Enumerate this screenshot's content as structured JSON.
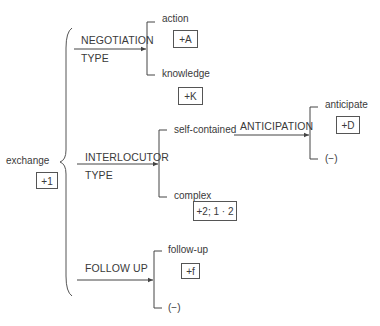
{
  "root": {
    "label": "exchange",
    "feature": "+1"
  },
  "systems": [
    {
      "name_line1": "NEGOTIATION",
      "name_line2": "TYPE",
      "options": [
        {
          "label": "action",
          "feature": "+A"
        },
        {
          "label": "knowledge",
          "feature": "+K"
        }
      ]
    },
    {
      "name_line1": "INTERLOCUTOR",
      "name_line2": "TYPE",
      "options": [
        {
          "label": "self-contained",
          "feature": ""
        },
        {
          "label": "complex",
          "feature": "+2; 1 · 2"
        }
      ],
      "subsystem": {
        "name": "ANTICIPATION",
        "options": [
          {
            "label": "anticipate",
            "feature": "+D"
          },
          {
            "label": "(−)"
          }
        ]
      }
    },
    {
      "name_line1": "FOLLOW UP",
      "options": [
        {
          "label": "follow-up",
          "feature": "+f"
        },
        {
          "label": "(−)"
        }
      ]
    }
  ],
  "colors": {
    "line": "#444444",
    "text": "#3a3a3a"
  }
}
